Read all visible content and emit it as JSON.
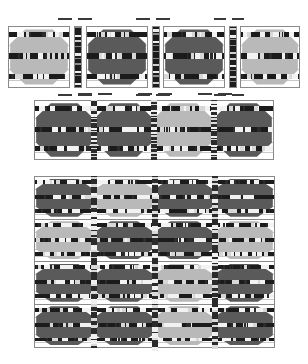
{
  "figure": {
    "type": "grayscale-raster-figure",
    "background": "#ffffff",
    "palette": {
      "light_fill": "#b9b9b9",
      "dark_fill": "#5a5a5a",
      "band": "#1b1b1b",
      "outline": "#8a8a8a",
      "rule": "#c9c9c9",
      "strip": "#1d1d1d",
      "page": "#ffffff"
    },
    "groups": [
      {
        "name": "top-row",
        "label": "Top row of four separated panels",
        "x": 8,
        "y": 26,
        "width": 292,
        "height": 62,
        "panel_count": 4,
        "strip_count": 3,
        "panels": [
          {
            "index": 0,
            "fill": "light",
            "x": 8,
            "width": 62
          },
          {
            "index": 1,
            "fill": "dark",
            "x": 86,
            "width": 62
          },
          {
            "index": 2,
            "fill": "dark",
            "x": 163,
            "width": 62
          },
          {
            "index": 3,
            "fill": "light",
            "x": 240,
            "width": 60
          }
        ],
        "strips": [
          {
            "index": 0,
            "x": 74,
            "width": 8
          },
          {
            "index": 1,
            "x": 152,
            "width": 8
          },
          {
            "index": 2,
            "x": 229,
            "width": 8
          }
        ],
        "tabs_above": [
          {
            "x": 58,
            "width": 14
          },
          {
            "x": 78,
            "width": 14
          },
          {
            "x": 136,
            "width": 14
          },
          {
            "x": 156,
            "width": 14
          },
          {
            "x": 214,
            "width": 12
          },
          {
            "x": 232,
            "width": 12
          }
        ],
        "tabs_below": [
          {
            "x": 58,
            "width": 14
          },
          {
            "x": 78,
            "width": 14
          },
          {
            "x": 136,
            "width": 14
          },
          {
            "x": 156,
            "width": 14
          },
          {
            "x": 214,
            "width": 12
          },
          {
            "x": 232,
            "width": 12
          }
        ]
      },
      {
        "name": "middle-band",
        "label": "Single contiguous row of four cells",
        "x": 34,
        "y": 100,
        "width": 240,
        "height": 60,
        "columns": 4,
        "rows": 1,
        "cells": [
          {
            "row": 0,
            "col": 0,
            "fill": "dark"
          },
          {
            "row": 0,
            "col": 1,
            "fill": "dark"
          },
          {
            "row": 0,
            "col": 2,
            "fill": "light"
          },
          {
            "row": 0,
            "col": 3,
            "fill": "dark"
          }
        ],
        "tabs_above": [
          {
            "x": 78,
            "width": 14
          },
          {
            "x": 98,
            "width": 14
          },
          {
            "x": 138,
            "width": 14
          },
          {
            "x": 158,
            "width": 14
          },
          {
            "x": 198,
            "width": 14
          },
          {
            "x": 218,
            "width": 14
          }
        ]
      },
      {
        "name": "bottom-grid",
        "label": "Four by four grid of cells",
        "x": 34,
        "y": 176,
        "width": 241,
        "height": 172,
        "columns": 4,
        "rows": 4,
        "cells": [
          {
            "row": 0,
            "col": 0,
            "fill": "dark"
          },
          {
            "row": 0,
            "col": 1,
            "fill": "light"
          },
          {
            "row": 0,
            "col": 2,
            "fill": "dark"
          },
          {
            "row": 0,
            "col": 3,
            "fill": "dark"
          },
          {
            "row": 1,
            "col": 0,
            "fill": "light"
          },
          {
            "row": 1,
            "col": 1,
            "fill": "dark"
          },
          {
            "row": 1,
            "col": 2,
            "fill": "dark"
          },
          {
            "row": 1,
            "col": 3,
            "fill": "light"
          },
          {
            "row": 2,
            "col": 0,
            "fill": "dark"
          },
          {
            "row": 2,
            "col": 1,
            "fill": "dark"
          },
          {
            "row": 2,
            "col": 2,
            "fill": "light"
          },
          {
            "row": 2,
            "col": 3,
            "fill": "dark"
          },
          {
            "row": 3,
            "col": 0,
            "fill": "dark"
          },
          {
            "row": 3,
            "col": 1,
            "fill": "dark"
          },
          {
            "row": 3,
            "col": 2,
            "fill": "light"
          },
          {
            "row": 3,
            "col": 3,
            "fill": "dark"
          }
        ]
      }
    ],
    "cell_motif": {
      "shape": "octagon",
      "bands": [
        {
          "name": "top",
          "top_pct": 8,
          "height_pct": 9
        },
        {
          "name": "middle",
          "top_pct": 44,
          "height_pct": 10
        },
        {
          "name": "bottom",
          "top_pct": 78,
          "height_pct": 9
        }
      ],
      "rules": [
        12,
        30,
        50,
        70,
        88
      ]
    }
  }
}
